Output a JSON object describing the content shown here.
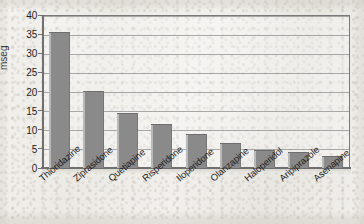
{
  "chart_data": {
    "type": "bar",
    "title": "",
    "xlabel": "",
    "ylabel": "mseg",
    "ylim": [
      0,
      40
    ],
    "ytick_step": 5,
    "yticks": [
      "0",
      "5",
      "10",
      "15",
      "20",
      "25",
      "30",
      "35",
      "40"
    ],
    "grid": true,
    "legend": "none",
    "categories": [
      "Thioridazine",
      "Ziprasidone",
      "Quetiapine",
      "Risperidone",
      "Iloperidone",
      "Olanzapine",
      "Haloperidol",
      "Aripiprazole",
      "Asenapine"
    ],
    "values": [
      35.6,
      20.1,
      14.5,
      11.5,
      8.8,
      6.6,
      4.7,
      4.3,
      3.1
    ],
    "bar_color": "#8a8a8a",
    "grid_color": "#9a9a9a",
    "axis_color": "#6f6f6f",
    "background_color": "#f0eeea"
  }
}
